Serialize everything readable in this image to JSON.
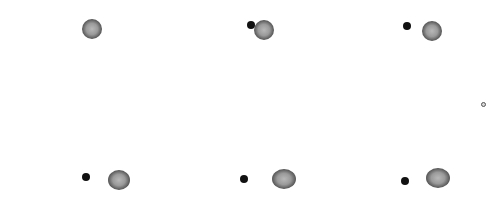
{
  "image": {
    "width": 493,
    "height": 209,
    "background": "#ffffff",
    "description": "Six frames of a large textured dark blob with an adjacent small solid dot, arranged in a 3x2 grid, plus a tiny ring at the right edge"
  },
  "frames": [
    {
      "big": {
        "cx": 92,
        "cy": 29,
        "rx": 10,
        "ry": 10
      },
      "small": null
    },
    {
      "big": {
        "cx": 264,
        "cy": 30,
        "rx": 10,
        "ry": 10
      },
      "small": {
        "cx": 251,
        "cy": 25,
        "r": 4
      }
    },
    {
      "big": {
        "cx": 432,
        "cy": 31,
        "rx": 10,
        "ry": 10
      },
      "small": {
        "cx": 407,
        "cy": 26,
        "r": 4
      }
    },
    {
      "big": {
        "cx": 119,
        "cy": 180,
        "rx": 11,
        "ry": 10
      },
      "small": {
        "cx": 86,
        "cy": 177,
        "r": 4
      }
    },
    {
      "big": {
        "cx": 284,
        "cy": 179,
        "rx": 12,
        "ry": 10
      },
      "small": {
        "cx": 244,
        "cy": 179,
        "r": 4
      }
    },
    {
      "big": {
        "cx": 438,
        "cy": 178,
        "rx": 12,
        "ry": 10
      },
      "small": {
        "cx": 405,
        "cy": 181,
        "r": 4
      }
    }
  ],
  "markers": [
    {
      "cx": 483,
      "cy": 104,
      "r": 2
    }
  ]
}
